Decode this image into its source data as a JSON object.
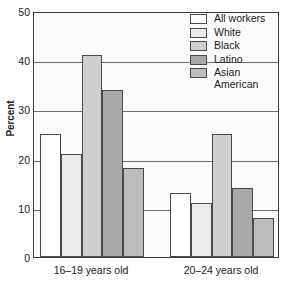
{
  "chart_data": {
    "type": "bar",
    "title": "",
    "xlabel": "",
    "ylabel": "Percent",
    "ylim": [
      0,
      50
    ],
    "yticks": [
      0,
      10,
      20,
      30,
      40,
      50
    ],
    "ytick_labels": [
      "0",
      "10",
      "20",
      "30",
      "40",
      "50"
    ],
    "grid": true,
    "legend_position": "top-right",
    "categories": [
      "16–19 years old",
      "20–24 years old"
    ],
    "series": [
      {
        "name": "All workers",
        "values": [
          25,
          13
        ],
        "color": "#ffffff"
      },
      {
        "name": "White",
        "values": [
          21,
          11
        ],
        "color": "#ebebeb"
      },
      {
        "name": "Black",
        "values": [
          41,
          25
        ],
        "color": "#cfcfcf"
      },
      {
        "name": "Latino",
        "values": [
          34,
          14
        ],
        "color": "#a8a8a8"
      },
      {
        "name": "Asian\nAmerican",
        "values": [
          18,
          8
        ],
        "color": "#bcbcbc"
      }
    ]
  },
  "legend": {
    "items": [
      {
        "label": "All workers"
      },
      {
        "label": "White"
      },
      {
        "label": "Black"
      },
      {
        "label": "Latino"
      },
      {
        "label": "Asian\nAmerican"
      }
    ]
  },
  "axis": {
    "y_label": "Percent",
    "y_ticks": [
      "0",
      "10",
      "20",
      "30",
      "40",
      "50"
    ],
    "x_groups": [
      "16–19 years old",
      "20–24 years old"
    ]
  },
  "bottom_caption": ""
}
